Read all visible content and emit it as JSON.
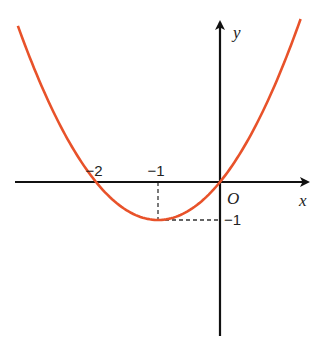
{
  "chart_data": {
    "type": "line",
    "title": "",
    "function": "y = x^2 + 2x",
    "xlabel": "x",
    "ylabel": "y",
    "origin_label": "O",
    "xlim": [
      -3.3,
      1.45
    ],
    "ylim": [
      -4.1,
      4.3
    ],
    "grid": false,
    "x_tick_labels": [
      {
        "value": -2,
        "label": "−2"
      },
      {
        "value": -1,
        "label": "−1"
      }
    ],
    "y_tick_labels": [
      {
        "value": -1,
        "label": "−1"
      }
    ],
    "key_points": [
      {
        "name": "root-left",
        "x": -2,
        "y": 0
      },
      {
        "name": "vertex",
        "x": -1,
        "y": -1
      },
      {
        "name": "origin",
        "x": 0,
        "y": 0
      }
    ],
    "series": [
      {
        "name": "parabola",
        "color": "#e8522a",
        "x_range": [
          -3.26,
          1.3
        ]
      }
    ],
    "guide_lines": [
      {
        "from": [
          -1,
          0
        ],
        "to": [
          -1,
          -1
        ],
        "style": "dashed"
      },
      {
        "from": [
          -1,
          -1
        ],
        "to": [
          0,
          -1
        ],
        "style": "dashed"
      }
    ],
    "axis_color": "#111111"
  }
}
